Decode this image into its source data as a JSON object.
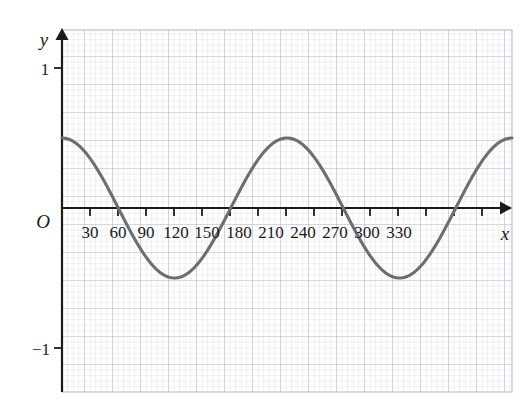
{
  "chart_data": {
    "type": "line",
    "title": "",
    "subtitle": "",
    "xlabel": "x",
    "ylabel": "y",
    "origin_label": "O",
    "xlim": [
      0,
      360
    ],
    "ylim": [
      -1.15,
      1.15
    ],
    "grid": true,
    "grid_minor": true,
    "legend": "none",
    "x_tick_labels": [
      "30",
      "60",
      "90",
      "120",
      "150",
      "180",
      "210",
      "240",
      "270",
      "300",
      "330"
    ],
    "x_tick_values": [
      30,
      60,
      90,
      120,
      150,
      180,
      210,
      240,
      270,
      300,
      330
    ],
    "y_tick_labels": [
      "1",
      "−1"
    ],
    "y_tick_values": [
      1,
      -1
    ],
    "series": [
      {
        "name": "y = 0.5 cos(2x)",
        "amplitude": 0.5,
        "period_degrees": 180,
        "phase_degrees": 0,
        "color": "#6e6e6e",
        "x": [
          0,
          10,
          20,
          30,
          40,
          45,
          50,
          60,
          70,
          80,
          90,
          100,
          110,
          120,
          130,
          135,
          140,
          150,
          160,
          170,
          180,
          190,
          200,
          210,
          220,
          225,
          230,
          240,
          250,
          260,
          270,
          280,
          290,
          300,
          310,
          315,
          320,
          330,
          340,
          350,
          360
        ],
        "y": [
          0.5,
          0.47,
          0.38,
          0.25,
          0.09,
          0,
          -0.09,
          -0.25,
          -0.38,
          -0.47,
          -0.5,
          -0.47,
          -0.38,
          -0.25,
          -0.09,
          0,
          0.09,
          0.25,
          0.38,
          0.47,
          0.5,
          0.47,
          0.38,
          0.25,
          0.09,
          0,
          -0.09,
          -0.25,
          -0.38,
          -0.47,
          -0.5,
          -0.47,
          -0.38,
          -0.25,
          -0.09,
          0,
          0.09,
          0.25,
          0.38,
          0.47,
          0.5
        ],
        "maxima_at_degrees": [
          0,
          180,
          360
        ],
        "minima_at_degrees": [
          90,
          270
        ],
        "zero_crossings_degrees": [
          45,
          135,
          225,
          315
        ]
      }
    ],
    "colors": {
      "curve": "#6e6e6e",
      "axis": "#1a1a1a",
      "grid_major": "#b9bdc9",
      "grid_minor": "#dfe2ea",
      "text": "#1a1a1a",
      "background": "#ffffff"
    }
  }
}
